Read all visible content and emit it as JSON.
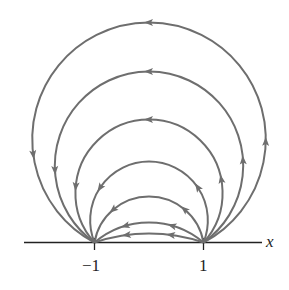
{
  "diagram": {
    "type": "field-lines",
    "axis": {
      "label": "x",
      "ticks": [
        {
          "value": -1,
          "label": "−1"
        },
        {
          "value": 1,
          "label": "1"
        }
      ]
    },
    "curves": [
      {
        "apex_height_px": 220
      },
      {
        "apex_height_px": 171
      },
      {
        "apex_height_px": 123
      },
      {
        "apex_height_px": 81
      },
      {
        "apex_height_px": 46
      },
      {
        "apex_height_px": 20
      },
      {
        "apex_height_px": 9
      }
    ],
    "colors": {
      "curve": "#6e6e6e",
      "axis": "#222222"
    }
  }
}
